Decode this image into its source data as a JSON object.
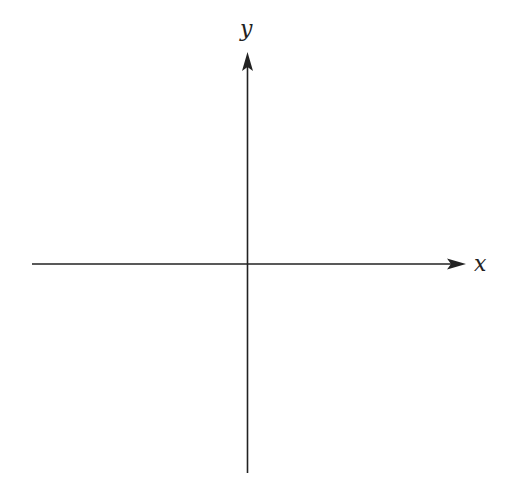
{
  "diagram": {
    "type": "cartesian-axes",
    "axes": {
      "x": {
        "label": "x",
        "direction": "right",
        "arrow": true
      },
      "y": {
        "label": "y",
        "direction": "up",
        "arrow": true
      }
    },
    "origin_marker": false,
    "line_color": "#222222",
    "background": "#ffffff"
  }
}
